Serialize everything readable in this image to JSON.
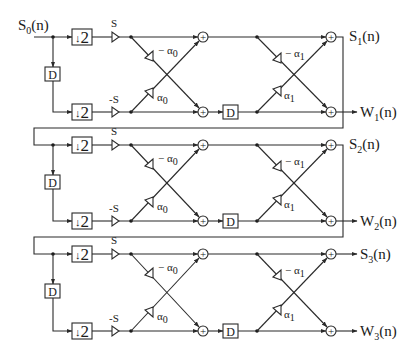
{
  "input": {
    "label": "S",
    "sub": "0",
    "suffix": "(n)"
  },
  "blocks": {
    "downsample_label": "↓2",
    "downsample_arrow": "↓",
    "downsample_factor": "2",
    "delay_label": "D",
    "adder_symbol": "+"
  },
  "gains": {
    "top_amp": "S",
    "bottom_amp": "-S",
    "stage_a_cross_top": "− α",
    "stage_a_cross_top_sub": "0",
    "stage_a_cross_bottom": "α",
    "stage_a_cross_bottom_sub": "0",
    "stage_b_cross_top": "− α",
    "stage_b_cross_top_sub": "1",
    "stage_b_cross_bottom": "α",
    "stage_b_cross_bottom_sub": "1"
  },
  "stages": [
    {
      "s_out": "S",
      "s_sub": "1",
      "w_out": "W",
      "w_sub": "1",
      "suffix": "(n)"
    },
    {
      "s_out": "S",
      "s_sub": "2",
      "w_out": "W",
      "w_sub": "2",
      "suffix": "(n)"
    },
    {
      "s_out": "S",
      "s_sub": "3",
      "w_out": "W",
      "w_sub": "3",
      "suffix": "(n)"
    }
  ],
  "colors": {
    "line": "#2a2a2a",
    "background": "#ffffff"
  }
}
